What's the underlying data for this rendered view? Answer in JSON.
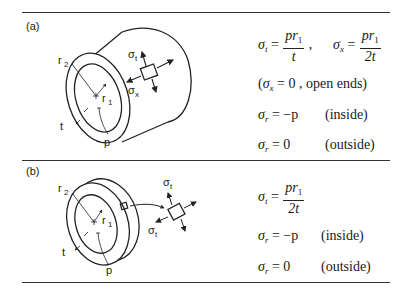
{
  "panels": [
    {
      "label": "(a)",
      "figure": "thick-walled cylinder with stress element",
      "figure_labels": {
        "r2": "r",
        "r2_sub": "2",
        "r1": "r",
        "r1_sub": "1",
        "t": "t",
        "p": "p",
        "sigma_t": "σ",
        "sigma_t_sub": "t",
        "sigma_x": "σ",
        "sigma_x_sub": "x"
      },
      "equations": {
        "eq1": {
          "lhs": "σ",
          "lhs_sub": "t",
          "eq": " = ",
          "num": "pr",
          "num_sub": "1",
          "den": "t",
          "trail": " ,"
        },
        "eq2": {
          "lhs": "σ",
          "lhs_sub": "x",
          "eq": " = ",
          "num": "pr",
          "num_sub": "1",
          "den": "2t"
        },
        "eq3": {
          "open": "(",
          "lhs": "σ",
          "lhs_sub": "x",
          "eq": " = 0 ,  ",
          "note": "open ends)"
        },
        "eq4": {
          "lhs": "σ",
          "lhs_sub": "r",
          "rhs": " = −p",
          "note": "(inside)"
        },
        "eq5": {
          "lhs": "σ",
          "lhs_sub": "r",
          "rhs": " = 0",
          "note": "(outside)"
        }
      }
    },
    {
      "label": "(b)",
      "figure": "thin ring with stress element",
      "figure_labels": {
        "r2": "r",
        "r2_sub": "2",
        "r1": "r",
        "r1_sub": "1",
        "t": "t",
        "p": "p",
        "sigma_t_top": "σ",
        "sigma_t_top_sub": "t",
        "sigma_t_left": "σ",
        "sigma_t_left_sub": "t"
      },
      "equations": {
        "eq1": {
          "lhs": "σ",
          "lhs_sub": "t",
          "eq": " = ",
          "num": "pr",
          "num_sub": "1",
          "den": "2t"
        },
        "eq2": {
          "lhs": "σ",
          "lhs_sub": "r",
          "rhs": " = −p",
          "note": "(inside)"
        },
        "eq3": {
          "lhs": "σ",
          "lhs_sub": "r",
          "rhs": " = 0",
          "note": "(outside)"
        }
      }
    }
  ]
}
